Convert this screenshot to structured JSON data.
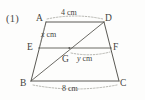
{
  "figure": {
    "problem_number": "(1)",
    "shape": "trapezoid",
    "vertices": [
      {
        "id": "A",
        "label": "A",
        "x": 41,
        "y": 22
      },
      {
        "id": "D",
        "label": "D",
        "x": 108,
        "y": 22
      },
      {
        "id": "E",
        "label": "E",
        "x": 35,
        "y": 48
      },
      {
        "id": "F",
        "label": "F",
        "x": 114,
        "y": 48
      },
      {
        "id": "G",
        "label": "G",
        "x": 69,
        "y": 52
      },
      {
        "id": "B",
        "label": "B",
        "x": 29,
        "y": 82
      },
      {
        "id": "C",
        "label": "C",
        "x": 121,
        "y": 82
      }
    ],
    "measures": [
      {
        "id": "ad",
        "label": "4 cm",
        "value": 4,
        "unit": "cm",
        "segment": "AD"
      },
      {
        "id": "ae",
        "label": "x cm",
        "variable": "x",
        "unit": "cm",
        "segment": "AE"
      },
      {
        "id": "gf",
        "label": "y cm",
        "variable": "y",
        "unit": "cm",
        "segment": "GF"
      },
      {
        "id": "bc",
        "label": "8 cm",
        "value": 8,
        "unit": "cm",
        "segment": "BC"
      }
    ],
    "segments": [
      {
        "id": "AD",
        "from": "A",
        "to": "D",
        "style": "solid"
      },
      {
        "id": "AB",
        "from": "A",
        "to": "B",
        "style": "solid"
      },
      {
        "id": "DC",
        "from": "D",
        "to": "C",
        "style": "solid"
      },
      {
        "id": "BC",
        "from": "B",
        "to": "C",
        "style": "solid"
      },
      {
        "id": "EF",
        "from": "E",
        "to": "F",
        "style": "solid"
      },
      {
        "id": "BD",
        "from": "B",
        "to": "D",
        "style": "solid"
      }
    ],
    "arcs": [
      {
        "id": "arc-ad",
        "label": "4 cm",
        "style": "dashed",
        "position": "above-AD"
      },
      {
        "id": "arc-bc",
        "label": "8 cm",
        "style": "dashed",
        "position": "below-BC"
      },
      {
        "id": "arc-ae",
        "label": "x cm",
        "style": "dashed",
        "position": "along-AE"
      },
      {
        "id": "arc-gf",
        "label": "y cm",
        "style": "dashed",
        "position": "along-GF"
      }
    ],
    "colors": {
      "line": "#5a5954",
      "dashed": "#8e8d87",
      "text": "#45443f",
      "background": "#fdfdfc"
    }
  }
}
